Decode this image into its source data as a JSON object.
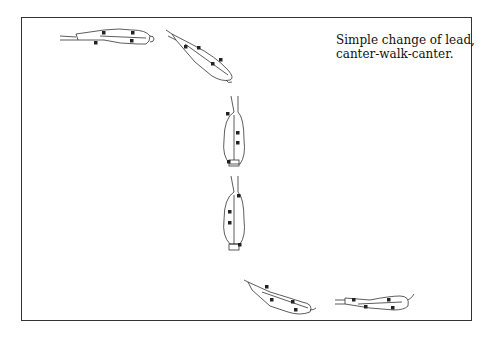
{
  "caption": {
    "line1": "Simple change of lead,",
    "line2": "canter-walk-canter."
  },
  "figures": [
    {
      "name": "horse-canter-start",
      "orientation": "left-to-right"
    },
    {
      "name": "horse-turning",
      "orientation": "diagonal-down-right"
    },
    {
      "name": "horse-walk-1",
      "orientation": "vertical"
    },
    {
      "name": "horse-walk-2",
      "orientation": "vertical"
    },
    {
      "name": "horse-turning-2",
      "orientation": "diagonal"
    },
    {
      "name": "horse-canter-end",
      "orientation": "left-to-right"
    }
  ]
}
